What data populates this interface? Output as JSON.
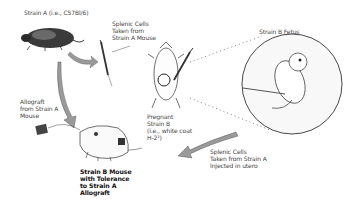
{
  "diagram": {
    "labels": {
      "strain_a": "Strain A (i.e., C57Bl/6)",
      "splenic_top_1": "Splenic Cells",
      "splenic_top_2": "Taken from",
      "splenic_top_3": "Strain A Mouse",
      "fetus": "Strain B Fetus",
      "allograft_1": "Allograft",
      "allograft_2": "from Strain A",
      "allograft_3": "Mouse",
      "pregnant_1": "Pregnant",
      "pregnant_2": "Strain B",
      "pregnant_3": "(i.e., white coat",
      "pregnant_4": "H-2²)",
      "splenic_bottom_1": "Splenic Cells",
      "splenic_bottom_2": "Taken from Strain A",
      "splenic_bottom_3": "Injected in utero",
      "result_1": "Strain B Mouse",
      "result_2": "with Tolerance",
      "result_3": "to Strain A",
      "result_4": "Allograft"
    },
    "colors": {
      "ink": "#222222",
      "arrow_fill": "#9a9a9a",
      "background": "#ffffff"
    }
  }
}
